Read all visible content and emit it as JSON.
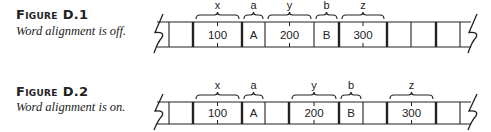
{
  "figures": [
    {
      "title": "Figure D.1",
      "caption": "Word alignment is off.",
      "strip": {
        "top": 22,
        "bottom": 47,
        "borders": [
          169,
          193,
          242,
          265,
          314,
          339,
          387,
          411,
          436,
          460
        ],
        "thick_borders": [
          193,
          242,
          339,
          387,
          436
        ],
        "cells": [
          {
            "x0": 193,
            "x1": 242,
            "text": "100"
          },
          {
            "x0": 242,
            "x1": 265,
            "text": "A"
          },
          {
            "x0": 265,
            "x1": 314,
            "text": "200"
          },
          {
            "x0": 314,
            "x1": 339,
            "text": "B"
          },
          {
            "x0": 339,
            "x1": 387,
            "text": "300"
          }
        ],
        "labels": [
          {
            "x0": 196,
            "x1": 239,
            "text": "x"
          },
          {
            "x0": 244,
            "x1": 263,
            "text": "a"
          },
          {
            "x0": 268,
            "x1": 311,
            "text": "y"
          },
          {
            "x0": 316,
            "x1": 337,
            "text": "b"
          },
          {
            "x0": 342,
            "x1": 384,
            "text": "z"
          }
        ]
      }
    },
    {
      "title": "Figure D.2",
      "caption": "Word alignment is on.",
      "strip": {
        "top": 102,
        "bottom": 124,
        "borders": [
          169,
          193,
          242,
          265,
          289,
          339,
          363,
          387,
          436,
          460
        ],
        "thick_borders": [
          193,
          242,
          289,
          339,
          387,
          436
        ],
        "cells": [
          {
            "x0": 193,
            "x1": 242,
            "text": "100"
          },
          {
            "x0": 242,
            "x1": 265,
            "text": "A"
          },
          {
            "x0": 289,
            "x1": 339,
            "text": "200"
          },
          {
            "x0": 339,
            "x1": 363,
            "text": "B"
          },
          {
            "x0": 387,
            "x1": 436,
            "text": "300"
          }
        ],
        "labels": [
          {
            "x0": 196,
            "x1": 239,
            "text": "x"
          },
          {
            "x0": 244,
            "x1": 263,
            "text": "a"
          },
          {
            "x0": 292,
            "x1": 336,
            "text": "y"
          },
          {
            "x0": 341,
            "x1": 361,
            "text": "b"
          },
          {
            "x0": 390,
            "x1": 433,
            "text": "z"
          }
        ]
      }
    }
  ]
}
